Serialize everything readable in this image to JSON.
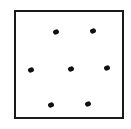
{
  "diagram": {
    "frame": {
      "left": 14,
      "top": 10,
      "right": 125,
      "bottom": 120
    },
    "dots": [
      {
        "x": 56,
        "y": 32
      },
      {
        "x": 93,
        "y": 31
      },
      {
        "x": 31,
        "y": 70
      },
      {
        "x": 71,
        "y": 69
      },
      {
        "x": 107,
        "y": 68
      },
      {
        "x": 51,
        "y": 105
      },
      {
        "x": 88,
        "y": 104
      }
    ],
    "colors": {
      "ink": "#111111",
      "background": "#ffffff"
    }
  }
}
